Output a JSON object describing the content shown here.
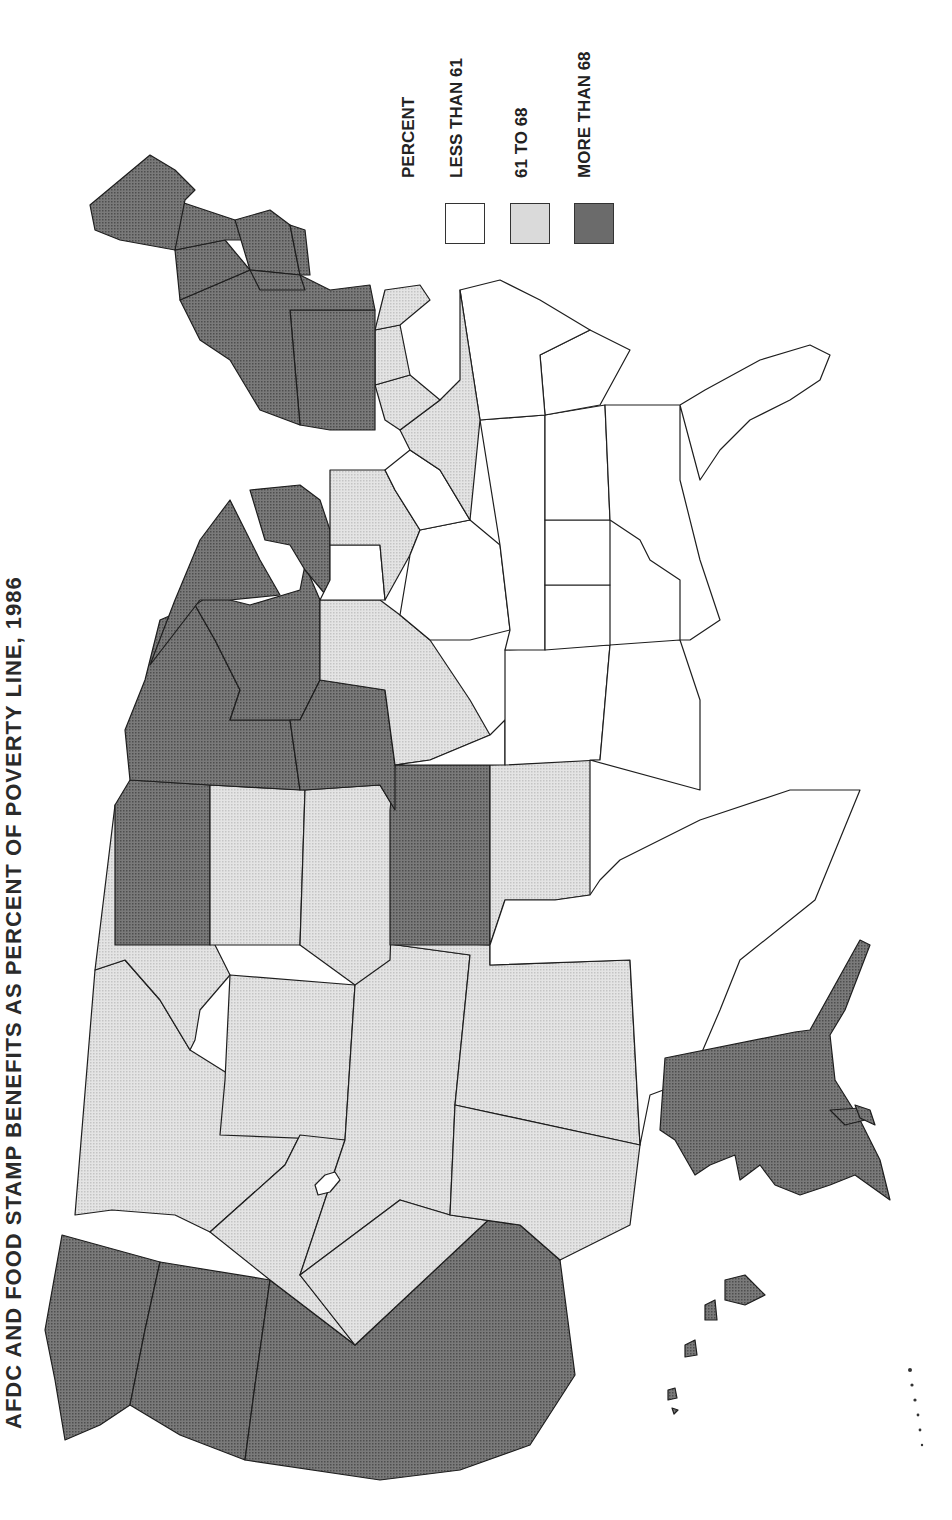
{
  "title": "AFDC AND FOOD STAMP BENEFITS AS PERCENT OF POVERTY LINE, 1986",
  "legend": {
    "heading": "PERCENT",
    "items": [
      {
        "label": "LESS THAN 61",
        "class": "low",
        "color": "#ffffff"
      },
      {
        "label": "61 TO 68",
        "class": "mid",
        "color": "#dadada"
      },
      {
        "label": "MORE THAN 68",
        "class": "high",
        "color": "#6b6b6b"
      }
    ]
  },
  "colors": {
    "low": "#ffffff",
    "mid": "#dadada",
    "high": "#6b6b6b",
    "border": "#1e1e1e"
  },
  "orientation": "rotated 90° counter-clockwise (north points left)",
  "states": {
    "high": [
      "Washington",
      "Oregon",
      "California",
      "North Dakota",
      "Minnesota",
      "Wisconsin",
      "Michigan",
      "Iowa",
      "Kansas",
      "New York",
      "Pennsylvania",
      "Vermont",
      "New Hampshire",
      "Maine",
      "Massachusetts",
      "Rhode Island",
      "Connecticut",
      "Alaska",
      "Hawaii"
    ],
    "mid": [
      "Idaho",
      "Montana",
      "Wyoming",
      "Nevada",
      "Utah",
      "Colorado",
      "Arizona",
      "New Mexico",
      "South Dakota",
      "Nebraska",
      "Oklahoma",
      "Illinois",
      "Ohio",
      "Virginia",
      "Maryland",
      "Delaware",
      "New Jersey"
    ],
    "low": [
      "Texas",
      "Louisiana",
      "Arkansas",
      "Missouri",
      "Indiana",
      "Kentucky",
      "Tennessee",
      "Mississippi",
      "Alabama",
      "Georgia",
      "Florida",
      "South Carolina",
      "North Carolina",
      "West Virginia"
    ]
  }
}
